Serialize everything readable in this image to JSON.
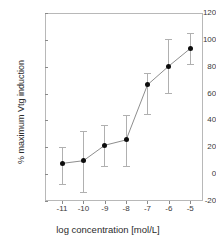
{
  "chart_data": {
    "type": "line",
    "title": "",
    "xlabel": "log concentration [mol/L]",
    "ylabel": "% maximum Vtg induction",
    "x": [
      -11,
      -10,
      -9,
      -8,
      -7,
      -6,
      -5
    ],
    "xticklabels": [
      "-11",
      "-10",
      "-9",
      "-8",
      "-7",
      "-6",
      "-5"
    ],
    "yticklabels": [
      "120",
      "100",
      "80",
      "60",
      "40",
      "20",
      "0",
      "-20"
    ],
    "yticks": [
      120,
      100,
      80,
      60,
      40,
      20,
      0,
      -20
    ],
    "xlim": [
      -11.8,
      -4.4
    ],
    "ylim": [
      -20,
      120
    ],
    "grid": false,
    "legend": null,
    "series": [
      {
        "name": "% maximum Vtg induction",
        "values": [
          8,
          10,
          21.5,
          25.5,
          66.5,
          80.5,
          93.5
        ],
        "error_upper": [
          20,
          32,
          36.5,
          44,
          75,
          101,
          105
        ],
        "error_lower": [
          -7,
          -13,
          6,
          6,
          45,
          60.5,
          82
        ],
        "marker": "filled-circle",
        "line_color": "#808080",
        "marker_color": "#0d0d0d",
        "errorbar_color": "#b0b0b0"
      }
    ]
  },
  "colors": {
    "background": "#ffffff",
    "frame": "#b8b8b8",
    "axis_text": "#3a3a3a",
    "axis_title": "#2b2b2b",
    "marker": "#0d0d0d",
    "line": "#808080",
    "errorbar": "#b0b0b0"
  },
  "caption": {
    "text": ""
  }
}
